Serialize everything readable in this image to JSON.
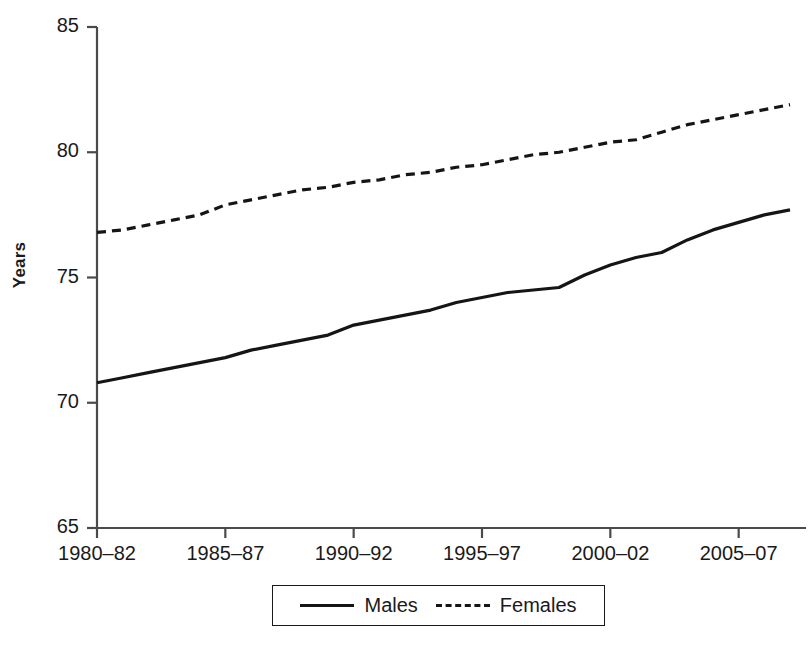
{
  "chart_data": {
    "type": "line",
    "title": "",
    "xlabel": "",
    "ylabel": "Years",
    "ylim": [
      65,
      85
    ],
    "yticks": [
      65,
      70,
      75,
      80,
      85
    ],
    "ytick_labels": [
      "65",
      "70",
      "75",
      "80",
      "85"
    ],
    "grid": false,
    "legend_position": "bottom",
    "categories": [
      "1980–82",
      "1981–83",
      "1982–84",
      "1983–85",
      "1984–86",
      "1985–87",
      "1986–88",
      "1987–89",
      "1988–90",
      "1989–91",
      "1990–92",
      "1991–93",
      "1992–94",
      "1993–95",
      "1994–96",
      "1995–97",
      "1996–98",
      "1997–99",
      "1998–00",
      "1999–01",
      "2000–02",
      "2001–03",
      "2002–04",
      "2003–05",
      "2004–06",
      "2005–07",
      "2006–08",
      "2007–09"
    ],
    "xtick_labels": [
      "1980–82",
      "1985–87",
      "1990–92",
      "1995–97",
      "2000–02",
      "2005–07"
    ],
    "xtick_indices": [
      0,
      5,
      10,
      15,
      20,
      25
    ],
    "series": [
      {
        "name": "Males",
        "style": "solid",
        "color": "#151515",
        "values": [
          70.8,
          71.0,
          71.2,
          71.4,
          71.6,
          71.8,
          72.1,
          72.3,
          72.5,
          72.7,
          73.1,
          73.3,
          73.5,
          73.7,
          74.0,
          74.2,
          74.4,
          74.5,
          74.6,
          75.1,
          75.5,
          75.8,
          76.0,
          76.5,
          76.9,
          77.2,
          77.5,
          77.7
        ]
      },
      {
        "name": "Females",
        "style": "dashed",
        "color": "#151515",
        "values": [
          76.8,
          76.9,
          77.1,
          77.3,
          77.5,
          77.9,
          78.1,
          78.3,
          78.5,
          78.6,
          78.8,
          78.9,
          79.1,
          79.2,
          79.4,
          79.5,
          79.7,
          79.9,
          80.0,
          80.2,
          80.4,
          80.5,
          80.8,
          81.1,
          81.3,
          81.5,
          81.7,
          81.9
        ]
      }
    ]
  },
  "legend": {
    "entries": [
      {
        "label": "Males",
        "style": "solid"
      },
      {
        "label": "Females",
        "style": "dashed"
      }
    ]
  },
  "axis": {
    "y_title": "Years"
  },
  "colors": {
    "line": "#151515",
    "axis": "#4a4a4a",
    "background": "#ffffff",
    "text": "#1a1a1a"
  }
}
